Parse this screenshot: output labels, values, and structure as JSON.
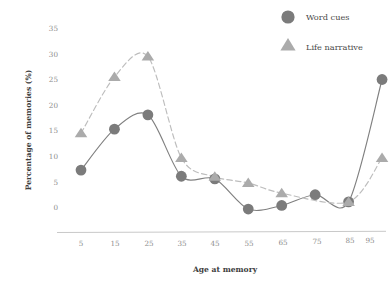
{
  "chart_data": {
    "type": "line",
    "title": "",
    "subtitle": "",
    "xlabel": "Age at memory",
    "ylabel": "Percentage of memories (%)",
    "x": [
      5,
      15,
      25,
      35,
      45,
      55,
      65,
      75,
      85,
      95
    ],
    "xticklabels": [
      "5",
      "15",
      "25",
      "35",
      "45",
      "55",
      "65",
      "75",
      "85",
      "95"
    ],
    "yticklabels": [
      "0",
      "5",
      "10",
      "15",
      "20",
      "25",
      "30",
      "35"
    ],
    "yticks": [
      0,
      5,
      10,
      15,
      20,
      25,
      30,
      35
    ],
    "ylim": [
      -2,
      35
    ],
    "xlim": [
      0,
      100
    ],
    "grid": false,
    "legend_position": "top-right",
    "series": [
      {
        "name": "Word cues",
        "marker": "circle",
        "linestyle": "solid",
        "color": "#7b7b7b",
        "values": [
          7.3,
          15.3,
          18.1,
          6.1,
          5.6,
          -0.3,
          0.4,
          2.5,
          1.1,
          25.0
        ]
      },
      {
        "name": "Life narrative",
        "marker": "triangle",
        "linestyle": "dashed",
        "color": "#ababab",
        "values": [
          14.5,
          25.5,
          29.5,
          9.7,
          6.0,
          4.8,
          2.8,
          null,
          1.1,
          9.7
        ]
      }
    ]
  },
  "legend": {
    "items": [
      {
        "label": "Word cues",
        "marker": "circle",
        "color": "#7b7b7b"
      },
      {
        "label": "Life narrative",
        "marker": "triangle",
        "color": "#ababab"
      }
    ]
  },
  "axes": {
    "x_title": "Age at memory",
    "y_title": "Percentage of memories (%)",
    "x_ticks": [
      "5",
      "15",
      "25",
      "35",
      "45",
      "55",
      "65",
      "75",
      "85",
      "95"
    ],
    "y_ticks": [
      "0",
      "5",
      "10",
      "15",
      "20",
      "25",
      "30",
      "35"
    ]
  },
  "colors": {
    "word_cues": "#7b7b7b",
    "life_narrative": "#ababab",
    "tick_text": "#8c8c8c",
    "axis_title": "#3d3d3d",
    "axis_line": "#c9c9c9",
    "background": "#ffffff"
  }
}
